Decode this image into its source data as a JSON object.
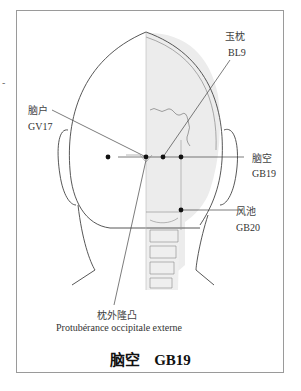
{
  "figure": {
    "title_chinese": "脑空",
    "title_code": "GB19",
    "stray_mark": "-"
  },
  "points": [
    {
      "chinese": "脑户",
      "code": "GV17"
    },
    {
      "chinese": "玉枕",
      "code": "BL9"
    },
    {
      "chinese": "脑空",
      "code": "GB19"
    },
    {
      "chinese": "风池",
      "code": "GB20"
    }
  ],
  "landmark": {
    "chinese": "枕外隆凸",
    "french": "Protubérance occipitale externe"
  },
  "colors": {
    "line": "#444444",
    "dot": "#111111",
    "skull_fill": "#eeeeee",
    "frame": "#9a9a9a"
  }
}
